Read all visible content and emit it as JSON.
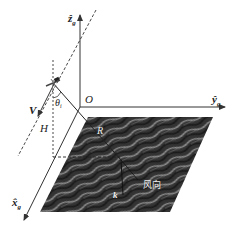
{
  "diagram": {
    "type": "geometry-schematic",
    "axes": {
      "z": {
        "label": "ẑ",
        "subscript": "g"
      },
      "y": {
        "label": "ŷ",
        "subscript": "g"
      },
      "x": {
        "label": "x̂",
        "subscript": "g"
      }
    },
    "labels": {
      "origin": "O",
      "velocity": "V",
      "height": "H",
      "range": "R",
      "wave_vector": "k",
      "incidence_angle": "θ",
      "incidence_angle_subscript": "i",
      "wind_direction": "风向"
    },
    "colors": {
      "line": "#333333",
      "sea_dark": "#2a2a2a",
      "sea_light": "#8a8a8a",
      "background": "#ffffff"
    }
  }
}
